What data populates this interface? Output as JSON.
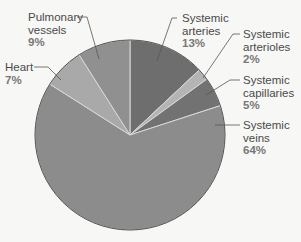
{
  "chart_data": {
    "type": "pie",
    "title": "",
    "start_angle_deg": 0,
    "direction": "clockwise",
    "center": [
      130,
      135
    ],
    "radius": 95,
    "slices": [
      {
        "key": "arteries",
        "label_lines": [
          "Systemic",
          "arteries"
        ],
        "value": 13,
        "pct_text": "13%",
        "color": "#6e6e6e"
      },
      {
        "key": "arterioles",
        "label_lines": [
          "Systemic",
          "arterioles"
        ],
        "value": 2,
        "pct_text": "2%",
        "color": "#b4b4b4"
      },
      {
        "key": "capillaries",
        "label_lines": [
          "Systemic",
          "capillaries"
        ],
        "value": 5,
        "pct_text": "5%",
        "color": "#727272"
      },
      {
        "key": "veins",
        "label_lines": [
          "Systemic",
          "veins"
        ],
        "value": 64,
        "pct_text": "64%",
        "color": "#8c8c8c"
      },
      {
        "key": "heart",
        "label_lines": [
          "Heart"
        ],
        "value": 7,
        "pct_text": "7%",
        "color": "#a9a9a9"
      },
      {
        "key": "pulmonary",
        "label_lines": [
          "Pulmonary",
          "vessels"
        ],
        "value": 9,
        "pct_text": "9%",
        "color": "#909090"
      }
    ],
    "categories": [
      "Systemic arteries",
      "Systemic arterioles",
      "Systemic capillaries",
      "Systemic veins",
      "Heart",
      "Pulmonary vessels"
    ],
    "values": [
      13,
      2,
      5,
      64,
      7,
      9
    ],
    "units": "%",
    "legend": "none (direct labels with leader lines)"
  },
  "labels": {
    "pulmonary": {
      "line1": "Pulmonary",
      "line2": "vessels",
      "pct": "9%"
    },
    "heart": {
      "line1": "Heart",
      "pct": "7%"
    },
    "arteries": {
      "line1": "Systemic",
      "line2": "arteries",
      "pct": "13%"
    },
    "arterioles": {
      "line1": "Systemic",
      "line2": "arterioles",
      "pct": "2%"
    },
    "capillaries": {
      "line1": "Systemic",
      "line2": "capillaries",
      "pct": "5%"
    },
    "veins": {
      "line1": "Systemic",
      "line2": "veins",
      "pct": "64%"
    }
  }
}
